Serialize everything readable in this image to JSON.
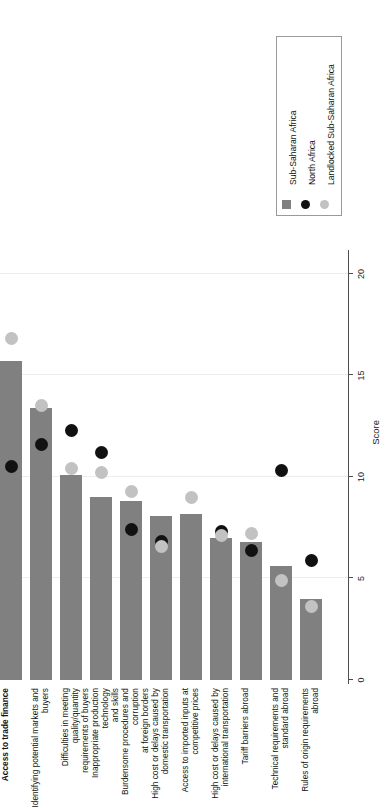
{
  "chart_data": {
    "type": "bar",
    "title": "",
    "subtitle": "",
    "xlabel": "",
    "ylabel": "Score",
    "axis_label": "Score",
    "orientation": "horizontal",
    "ylim": [
      0,
      21
    ],
    "tick_values": [
      0,
      5,
      10,
      15,
      20
    ],
    "tick_labels": [
      "0",
      "5",
      "10",
      "15",
      "20"
    ],
    "grid": true,
    "legend_position": "top-right",
    "categories": [
      "Access to trade finance",
      "Identifying potential markets and buyers",
      "Difficulties in meeting quality/quantity\nrequirements of buyers",
      "Inappropriate production technology\nand skills",
      "Burdensome procedures and corruption\nat foreign borders",
      "High cost or delays caused by\ndomestic transportation",
      "Access to imported inputs at\ncompetitive prices",
      "High cost or delays caused by\ninternational transportation",
      "Tariff barriers abroad",
      "Technical requirements and\nstandard abroad",
      "Rules of origin requirements abroad"
    ],
    "series": [
      {
        "name": "Sub-Saharan Africa",
        "mark": "bar",
        "color": "#808080",
        "values": [
          15.7,
          13.4,
          10.1,
          9.0,
          8.8,
          8.1,
          8.2,
          7.0,
          6.8,
          5.6,
          4.0
        ]
      },
      {
        "name": "North Africa",
        "mark": "dot",
        "color": "#111111",
        "values": [
          10.5,
          11.6,
          12.3,
          11.2,
          7.4,
          6.8,
          null,
          7.3,
          6.4,
          10.3,
          5.9
        ]
      },
      {
        "name": "Landlocked Sub-Saharan Africa",
        "mark": "dot",
        "color": "#c2c2c2",
        "values": [
          16.8,
          13.5,
          10.4,
          10.2,
          9.3,
          6.6,
          9.0,
          7.1,
          7.2,
          4.9,
          3.6
        ]
      }
    ]
  },
  "legend": {
    "items": [
      {
        "label": "Sub-Saharan Africa",
        "marker": "square-swatch",
        "color": "#808080"
      },
      {
        "label": "North Africa",
        "marker": "circle-swatch",
        "color": "#111111"
      },
      {
        "label": "Landlocked Sub-Saharan Africa",
        "marker": "circle-swatch",
        "color": "#c2c2c2"
      }
    ]
  }
}
